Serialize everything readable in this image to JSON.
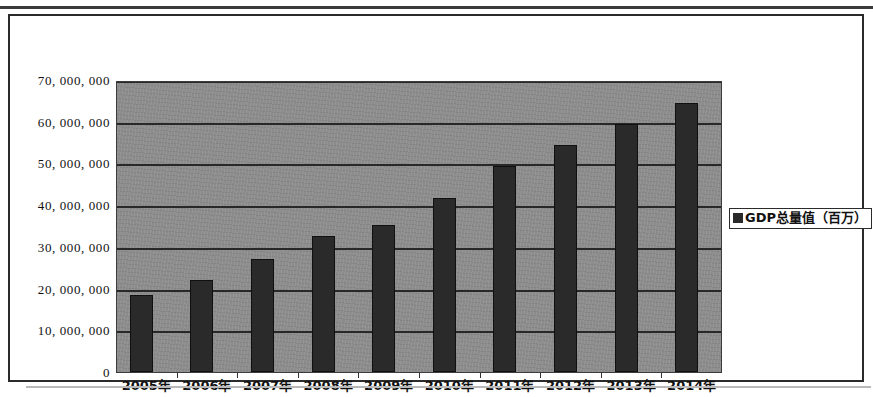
{
  "chart_data": {
    "type": "bar",
    "title": "",
    "xlabel": "",
    "ylabel": "",
    "categories": [
      "2005年",
      "2006年",
      "2007年",
      "2008年",
      "2009年",
      "2010年",
      "2011年",
      "2012年",
      "2013年",
      "2014年"
    ],
    "series": [
      {
        "name": "GDP总量值（百万）",
        "values": [
          18500000,
          22000000,
          27000000,
          32500000,
          35300000,
          41800000,
          49300000,
          54500000,
          59500000,
          64600000
        ]
      }
    ],
    "ylim": [
      0,
      70000000
    ],
    "ytick_values": [
      0,
      10000000,
      20000000,
      30000000,
      40000000,
      50000000,
      60000000,
      70000000
    ],
    "ytick_labels": [
      "0",
      "10, 000, 000",
      "20, 000, 000",
      "30, 000, 000",
      "40, 000, 000",
      "50, 000, 000",
      "60, 000, 000",
      "70, 000, 000"
    ],
    "grid": true,
    "legend_position": "right",
    "plot_background": "#8c8c8c",
    "bar_color": "#2a2a2a",
    "gridline_color": "#282828"
  },
  "legend": {
    "label": "GDP总量值（百万）",
    "swatch_name": "series-color-swatch"
  }
}
